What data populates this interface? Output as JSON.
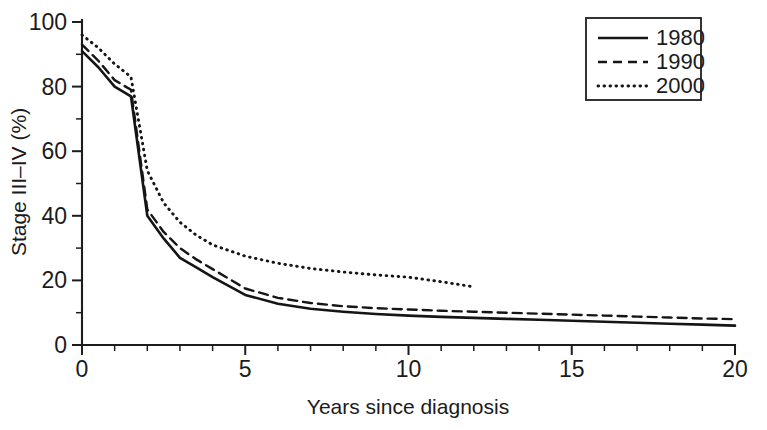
{
  "chart_data": {
    "type": "line",
    "title": "",
    "xlabel": "Years since diagnosis",
    "ylabel": "Stage III–IV (%)",
    "xlim": [
      0,
      20
    ],
    "ylim": [
      0,
      100
    ],
    "grid": false,
    "legend_position": "top-right",
    "x_ticks": [
      0,
      5,
      10,
      15,
      20
    ],
    "x_tick_labels": [
      "0",
      "5",
      "10",
      "15",
      "20"
    ],
    "x_minor_step": 1,
    "y_ticks": [
      0,
      20,
      40,
      60,
      80,
      100
    ],
    "y_tick_labels": [
      "0",
      "20",
      "40",
      "60",
      "80",
      "100"
    ],
    "y_minor_step": 10,
    "series": [
      {
        "name": "1980",
        "style": "solid",
        "color": "#151515",
        "x": [
          0,
          0.5,
          1,
          1.5,
          2,
          2.5,
          3,
          3.5,
          4,
          5,
          6,
          7,
          8,
          9,
          10,
          11,
          12,
          13,
          14,
          15,
          16,
          17,
          18,
          19,
          20
        ],
        "values": [
          91,
          86,
          80,
          77,
          40,
          33,
          27,
          24,
          21,
          15.5,
          12.8,
          11.2,
          10.3,
          9.6,
          9.1,
          8.7,
          8.4,
          8.1,
          7.8,
          7.5,
          7.2,
          6.9,
          6.6,
          6.3,
          6.0
        ]
      },
      {
        "name": "1990",
        "style": "dashed",
        "color": "#151515",
        "x": [
          0,
          0.5,
          1,
          1.5,
          2,
          2.5,
          3,
          3.5,
          4,
          5,
          6,
          7,
          8,
          9,
          10,
          11,
          12,
          13,
          14,
          15,
          16,
          17,
          18,
          19,
          20
        ],
        "values": [
          93,
          88,
          82,
          79,
          42,
          35,
          30,
          26.5,
          23.5,
          17.5,
          14.6,
          13.0,
          12.0,
          11.4,
          11.0,
          10.6,
          10.3,
          10.0,
          9.7,
          9.4,
          9.1,
          8.8,
          8.5,
          8.2,
          8.0
        ]
      },
      {
        "name": "2000",
        "style": "dotted",
        "color": "#151515",
        "x": [
          0,
          0.5,
          1,
          1.5,
          2,
          2.5,
          3,
          3.5,
          4,
          5,
          6,
          7,
          8,
          9,
          10,
          11,
          12
        ],
        "values": [
          96,
          92,
          87,
          83,
          54,
          44,
          38,
          34,
          31,
          27.5,
          25.3,
          23.7,
          22.6,
          21.7,
          21.0,
          19.6,
          18.0
        ]
      }
    ],
    "legend_entries": [
      "1980",
      "1990",
      "2000"
    ]
  }
}
